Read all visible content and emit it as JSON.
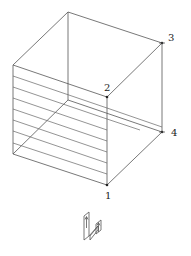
{
  "diagram": {
    "type": "isometric-box",
    "vertices": {
      "back_top_left": [
        68,
        12
      ],
      "back_top_right": [
        162,
        43
      ],
      "front_top_left": [
        13,
        65
      ],
      "front_top_right": [
        107,
        97
      ],
      "back_bottom_left": [
        68,
        100
      ],
      "back_bottom_right": [
        162,
        132
      ],
      "front_bottom_left": [
        13,
        154
      ],
      "front_bottom_right": [
        107,
        185
      ]
    },
    "points": [
      {
        "id": "1",
        "label": "1",
        "x": 107,
        "y": 185,
        "label_x": 105,
        "label_y": 198
      },
      {
        "id": "2",
        "label": "2",
        "x": 107,
        "y": 97,
        "label_x": 104,
        "label_y": 90
      },
      {
        "id": "3",
        "label": "3",
        "x": 162,
        "y": 43,
        "label_x": 168,
        "label_y": 40
      },
      {
        "id": "4",
        "label": "4",
        "x": 162,
        "y": 132,
        "label_x": 170,
        "label_y": 136
      }
    ],
    "stripes_count": 7,
    "colors": {
      "line": "#555555",
      "text": "#222222",
      "background": "#ffffff"
    }
  },
  "orientation_icon": {
    "name": "orientation-icon",
    "arrows": [
      "up",
      "up"
    ]
  }
}
